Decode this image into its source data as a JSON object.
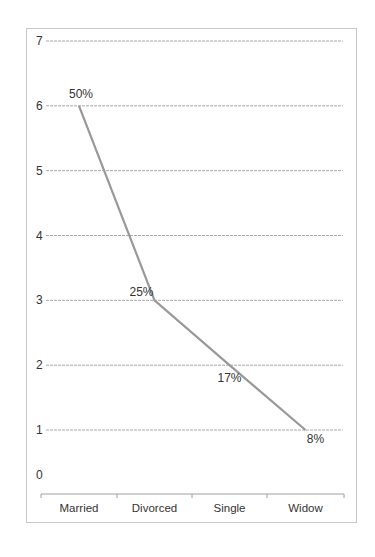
{
  "chart_data": {
    "type": "line",
    "title": "",
    "xlabel": "",
    "ylabel": "",
    "categories": [
      "Married",
      "Divorced",
      "Single",
      "Widow"
    ],
    "series": [
      {
        "name": "Marital status",
        "values": [
          6,
          3,
          2,
          1
        ],
        "data_labels": [
          "50%",
          "25%",
          "17%",
          "8%"
        ],
        "color": "#999999"
      }
    ],
    "ylim": [
      0,
      7
    ],
    "yticks": [
      "0",
      "1",
      "2",
      "3",
      "4",
      "5",
      "6",
      "7"
    ],
    "grid": true,
    "legend": "none"
  }
}
